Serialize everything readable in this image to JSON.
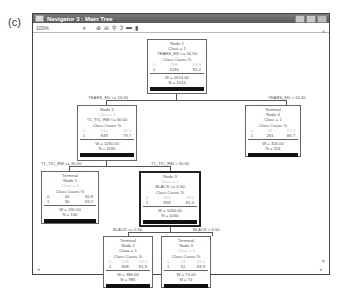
{
  "panel_label": "(c)",
  "window": {
    "title": "Navigator 3 : Main Tree",
    "zoom_value": "100%",
    "toolbar_icons": [
      "zoom-in-icon",
      "zoom-out-icon",
      "tree-icon",
      "tree-alt-icon",
      "minus-icon",
      "panel-icon"
    ],
    "toolbar_glyphs": [
      "⊕",
      "⊖",
      "⚲",
      "⚳",
      "▬",
      "▮"
    ]
  },
  "tree": {
    "node1": {
      "title": "Node 1",
      "class": "Class = 1",
      "split": "YEARS_ED <= 16.50",
      "hdr": "Class  Cases   %",
      "r0": [
        "0",
        "284",
        "18.8"
      ],
      "r1": [
        "1",
        "1230",
        "81.2"
      ],
      "w": "W = 1514.00",
      "n": "N = 1514"
    },
    "edge_left1": "YEARS_ED <= 16.50",
    "edge_right1": "YEARS_ED > 16.50",
    "node2": {
      "title": "Node 2",
      "class": "Class = 1",
      "split": "T1_TIC_RM <= 30.00",
      "hdr": "Class  Cases   %",
      "r0": [
        "0",
        "241",
        "20.3"
      ],
      "r1": [
        "1",
        "949",
        "79.7"
      ],
      "w": "W = 1190.00",
      "n": "N = 1190"
    },
    "node4": {
      "kind": "Terminal",
      "title": "Node 4",
      "class": "Class = 1",
      "hdr": "Class  Cases   %",
      "r0": [
        "0",
        "43",
        "13.3"
      ],
      "r1": [
        "1",
        "281",
        "86.7"
      ],
      "w": "W = 324.00",
      "n": "N = 324"
    },
    "edge_left2": "T1_TIC_RM <= 30.00",
    "edge_right2": "T1_TIC_RM > 30.00",
    "node1t": {
      "kind": "Terminal",
      "title": "Node 1",
      "class": "Class = 0",
      "hdr": "Class  Cases   %",
      "r0": [
        "0",
        "40",
        "30.8"
      ],
      "r1": [
        "1",
        "90",
        "69.2"
      ],
      "w": "W = 130.00",
      "n": "N = 130"
    },
    "node3": {
      "title": "Node 3",
      "class": "Class = 1",
      "split": "BLACK <= 0.50",
      "hdr": "Class  Cases   %",
      "r0": [
        "0",
        "201",
        "19.0"
      ],
      "r1": [
        "1",
        "859",
        "81.0"
      ],
      "w": "W = 1060.00",
      "n": "N = 1060"
    },
    "edge_left3": "BLACK <= 0.50",
    "edge_right3": "BLACK > 0.50",
    "node2t": {
      "kind": "Terminal",
      "title": "Node 2",
      "class": "Class = 1",
      "hdr": "Class  Cases   %",
      "r0": [
        "0",
        "178",
        "18.1"
      ],
      "r1": [
        "1",
        "808",
        "81.9"
      ],
      "w": "W = 986.00",
      "n": "N = 986"
    },
    "node3t": {
      "kind": "Terminal",
      "title": "Node 3",
      "class": "Class = 0",
      "hdr": "Class  Cases   %",
      "r0": [
        "0",
        "23",
        "31.1"
      ],
      "r1": [
        "1",
        "51",
        "68.9"
      ],
      "w": "W = 74.00",
      "n": "N = 74"
    }
  }
}
